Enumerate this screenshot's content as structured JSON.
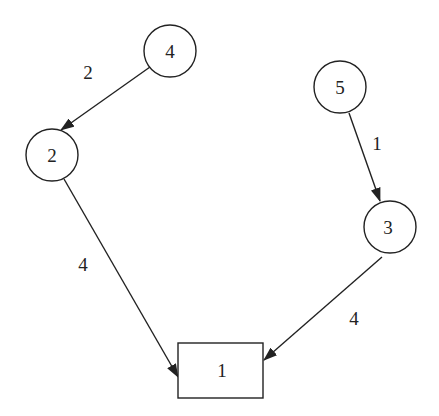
{
  "diagram": {
    "type": "directed-weighted-graph",
    "colors": {
      "stroke": "#222222",
      "background": "#ffffff"
    },
    "nodes": [
      {
        "id": "n4",
        "label": "4",
        "shape": "circle",
        "cx": 170,
        "cy": 51,
        "r": 26
      },
      {
        "id": "n2",
        "label": "2",
        "shape": "circle",
        "cx": 52,
        "cy": 155,
        "r": 26
      },
      {
        "id": "n5",
        "label": "5",
        "shape": "circle",
        "cx": 340,
        "cy": 87,
        "r": 26
      },
      {
        "id": "n3",
        "label": "3",
        "shape": "circle",
        "cx": 390,
        "cy": 227,
        "r": 26
      },
      {
        "id": "n1",
        "label": "1",
        "shape": "rect",
        "x": 178,
        "y": 343,
        "w": 85,
        "h": 55
      }
    ],
    "edges": [
      {
        "from": "4",
        "to": "2",
        "weight": "2"
      },
      {
        "from": "5",
        "to": "3",
        "weight": "1"
      },
      {
        "from": "2",
        "to": "1",
        "weight": "4"
      },
      {
        "from": "3",
        "to": "1",
        "weight": "4"
      }
    ]
  }
}
